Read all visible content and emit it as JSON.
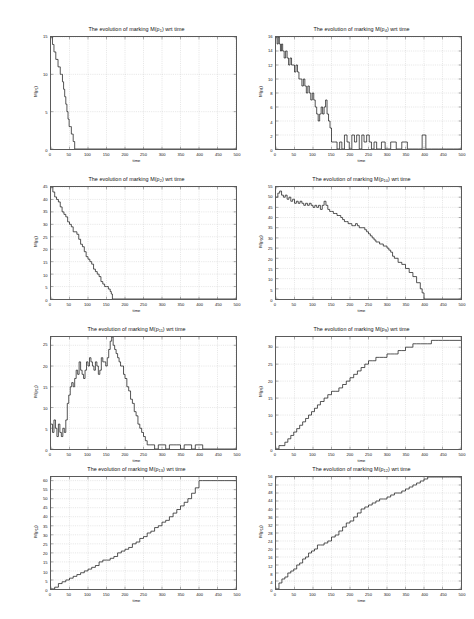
{
  "figure": {
    "background": "#ffffff",
    "line_color": "#1a1a1a",
    "grid_color": "#b9b9b9",
    "axis_color": "#5a5a5a",
    "xlabel": "time",
    "title_prefix": "The evolution of marking M(p",
    "title_suffix": ") wrt time"
  },
  "chart_data": [
    {
      "type": "line",
      "id": "p1",
      "title": "The evolution of marking M(p1) wrt time",
      "place_index": "1",
      "xlabel": "time",
      "ylabel": "M(p1)",
      "xlim": [
        0,
        500
      ],
      "ylim": [
        0,
        15
      ],
      "xticks": [
        0,
        50,
        100,
        150,
        200,
        250,
        300,
        350,
        400,
        450,
        500
      ],
      "yticks": [
        0,
        5,
        10,
        15
      ],
      "grid": true,
      "legend": "none",
      "x": [
        0,
        2,
        4,
        6,
        8,
        10,
        13,
        16,
        19,
        22,
        25,
        28,
        31,
        34,
        37,
        40,
        43,
        46,
        49,
        52,
        55,
        58,
        60,
        62,
        64,
        500
      ],
      "y": [
        15,
        15,
        14,
        14,
        13,
        13,
        12,
        12,
        11,
        11,
        10,
        10,
        9,
        8,
        7,
        6,
        5,
        4,
        3,
        3,
        2,
        2,
        1,
        1,
        0,
        0
      ]
    },
    {
      "type": "line",
      "id": "p4",
      "title": "The evolution of marking M(p4) wrt time",
      "place_index": "4",
      "xlabel": "time",
      "ylabel": "M(p4)",
      "xlim": [
        0,
        500
      ],
      "ylim": [
        0,
        16
      ],
      "xticks": [
        0,
        50,
        100,
        150,
        200,
        250,
        300,
        350,
        400,
        450,
        500
      ],
      "yticks": [
        0,
        2,
        4,
        6,
        8,
        10,
        12,
        14,
        16
      ],
      "grid": true,
      "legend": "none",
      "x": [
        0,
        3,
        6,
        9,
        12,
        15,
        18,
        22,
        26,
        30,
        34,
        38,
        42,
        46,
        50,
        54,
        58,
        62,
        66,
        70,
        74,
        78,
        82,
        86,
        90,
        94,
        98,
        102,
        106,
        110,
        114,
        118,
        122,
        126,
        130,
        134,
        138,
        142,
        146,
        150,
        158,
        165,
        172,
        178,
        185,
        192,
        198,
        205,
        212,
        218,
        225,
        232,
        238,
        245,
        252,
        258,
        265,
        272,
        285,
        295,
        310,
        325,
        340,
        355,
        370,
        385,
        395,
        400,
        405,
        410,
        420,
        440,
        460,
        480,
        500
      ],
      "y": [
        16,
        15,
        16,
        15,
        14,
        15,
        14,
        13,
        14,
        13,
        12,
        13,
        12,
        12,
        11,
        12,
        11,
        10,
        10,
        9,
        10,
        9,
        8,
        9,
        8,
        7,
        8,
        7,
        6,
        5,
        4,
        5,
        6,
        5,
        6,
        7,
        5,
        4,
        3,
        1,
        1,
        0,
        1,
        0,
        2,
        1,
        0,
        2,
        1,
        2,
        0,
        2,
        1,
        2,
        1,
        0,
        1,
        0,
        1,
        0,
        1,
        0,
        1,
        0,
        0,
        0,
        2,
        2,
        0,
        0,
        0,
        0,
        0,
        0,
        0
      ]
    },
    {
      "type": "line",
      "id": "p2",
      "title": "The evolution of marking M(p2) wrt time",
      "place_index": "2",
      "xlabel": "time",
      "ylabel": "M(p2)",
      "xlim": [
        0,
        500
      ],
      "ylim": [
        0,
        45
      ],
      "xticks": [
        0,
        50,
        100,
        150,
        200,
        250,
        300,
        350,
        400,
        450,
        500
      ],
      "yticks": [
        0,
        5,
        10,
        15,
        20,
        25,
        30,
        35,
        40,
        45
      ],
      "grid": true,
      "legend": "none",
      "x": [
        0,
        5,
        10,
        15,
        20,
        25,
        30,
        35,
        40,
        45,
        50,
        55,
        60,
        65,
        70,
        75,
        80,
        85,
        90,
        95,
        100,
        105,
        110,
        115,
        120,
        125,
        130,
        135,
        140,
        145,
        150,
        155,
        160,
        163,
        166,
        500
      ],
      "y": [
        45,
        43,
        41,
        40,
        39,
        37,
        35,
        34,
        33,
        31,
        30,
        29,
        27,
        27,
        26,
        24,
        22,
        21,
        19,
        17,
        16,
        15,
        14,
        12,
        11,
        10,
        9,
        7,
        6,
        5,
        5,
        4,
        3,
        2,
        0,
        0
      ]
    },
    {
      "type": "line",
      "id": "p10",
      "title": "The evolution of marking M(p10) wrt time",
      "place_index": "10",
      "xlabel": "time",
      "ylabel": "M(p10)",
      "xlim": [
        0,
        500
      ],
      "ylim": [
        0,
        55
      ],
      "xticks": [
        0,
        50,
        100,
        150,
        200,
        250,
        300,
        350,
        400,
        450,
        500
      ],
      "yticks": [
        0,
        5,
        10,
        15,
        20,
        25,
        30,
        35,
        40,
        45,
        50,
        55
      ],
      "grid": true,
      "legend": "none",
      "x": [
        0,
        5,
        10,
        15,
        20,
        25,
        30,
        35,
        40,
        45,
        50,
        55,
        60,
        65,
        70,
        75,
        80,
        85,
        90,
        95,
        100,
        105,
        110,
        115,
        120,
        125,
        130,
        135,
        140,
        145,
        150,
        155,
        160,
        165,
        170,
        175,
        180,
        185,
        190,
        195,
        200,
        205,
        210,
        215,
        220,
        225,
        230,
        235,
        240,
        245,
        250,
        255,
        260,
        265,
        270,
        280,
        290,
        300,
        305,
        310,
        315,
        320,
        330,
        340,
        350,
        360,
        370,
        380,
        390,
        395,
        400,
        500
      ],
      "y": [
        50,
        52,
        53,
        51,
        50,
        51,
        49,
        50,
        48,
        49,
        47,
        48,
        47,
        48,
        47,
        46,
        47,
        46,
        47,
        46,
        45,
        46,
        45,
        46,
        44,
        46,
        48,
        46,
        44,
        43,
        43,
        42,
        42,
        41,
        41,
        40,
        39,
        38,
        38,
        37,
        37,
        36,
        36,
        37,
        36,
        35,
        35,
        35,
        34,
        33,
        32,
        31,
        30,
        29,
        28,
        27,
        26,
        25,
        24,
        23,
        21,
        20,
        18,
        17,
        15,
        13,
        11,
        8,
        5,
        3,
        0,
        0
      ]
    },
    {
      "type": "line",
      "id": "p11",
      "title": "The evolution of marking M(p11) wrt time",
      "place_index": "11",
      "xlabel": "time",
      "ylabel": "M(p11)",
      "xlim": [
        0,
        500
      ],
      "ylim": [
        0,
        27
      ],
      "xticks": [
        0,
        50,
        100,
        150,
        200,
        250,
        300,
        350,
        400,
        450,
        500
      ],
      "yticks": [
        0,
        5,
        10,
        15,
        20,
        25
      ],
      "grid": true,
      "legend": "none",
      "x": [
        0,
        4,
        8,
        12,
        16,
        20,
        24,
        28,
        32,
        36,
        40,
        44,
        48,
        52,
        56,
        60,
        64,
        68,
        72,
        76,
        80,
        84,
        88,
        92,
        96,
        100,
        104,
        108,
        112,
        116,
        120,
        124,
        128,
        132,
        136,
        140,
        144,
        148,
        152,
        156,
        160,
        164,
        168,
        172,
        176,
        180,
        184,
        188,
        192,
        196,
        200,
        205,
        210,
        215,
        220,
        225,
        230,
        235,
        240,
        245,
        250,
        255,
        260,
        270,
        280,
        290,
        300,
        310,
        320,
        330,
        340,
        350,
        360,
        370,
        380,
        390,
        400,
        410,
        430,
        450,
        470,
        500
      ],
      "y": [
        6,
        4,
        7,
        5,
        3,
        6,
        4,
        3,
        5,
        4,
        7,
        11,
        13,
        15,
        16,
        15,
        17,
        19,
        18,
        21,
        19,
        18,
        17,
        19,
        21,
        20,
        22,
        21,
        20,
        19,
        21,
        20,
        18,
        19,
        22,
        21,
        21,
        20,
        22,
        24,
        26,
        27,
        25,
        24,
        23,
        22,
        21,
        20,
        20,
        18,
        17,
        15,
        14,
        12,
        11,
        9,
        8,
        6,
        5,
        4,
        3,
        2,
        1,
        1,
        0,
        1,
        1,
        0,
        1,
        1,
        1,
        0,
        1,
        1,
        0,
        1,
        1,
        0,
        0,
        0,
        0,
        0
      ]
    },
    {
      "type": "line",
      "id": "p9",
      "title": "The evolution of marking M(p9) wrt time",
      "place_index": "9",
      "xlabel": "time",
      "ylabel": "M(p9)",
      "xlim": [
        0,
        500
      ],
      "ylim": [
        0,
        33
      ],
      "xticks": [
        0,
        50,
        100,
        150,
        200,
        250,
        300,
        350,
        400,
        450,
        500
      ],
      "yticks": [
        0,
        5,
        10,
        15,
        20,
        25,
        30
      ],
      "grid": true,
      "legend": "none",
      "x": [
        0,
        8,
        16,
        24,
        32,
        40,
        48,
        56,
        64,
        72,
        80,
        88,
        96,
        104,
        112,
        120,
        130,
        140,
        150,
        160,
        170,
        180,
        190,
        200,
        210,
        220,
        230,
        240,
        250,
        260,
        270,
        280,
        290,
        300,
        310,
        320,
        330,
        340,
        350,
        360,
        370,
        380,
        390,
        400,
        410,
        420,
        430,
        440,
        450,
        470,
        500
      ],
      "y": [
        0,
        1,
        1,
        2,
        3,
        4,
        5,
        6,
        7,
        8,
        9,
        10,
        11,
        12,
        13,
        14,
        15,
        16,
        17,
        17,
        18,
        19,
        20,
        21,
        22,
        23,
        24,
        25,
        26,
        26,
        27,
        27,
        27,
        28,
        28,
        28,
        29,
        29,
        30,
        30,
        31,
        31,
        31,
        31,
        31,
        32,
        32,
        32,
        32,
        32,
        32
      ]
    },
    {
      "type": "line",
      "id": "p13",
      "title": "The evolution of marking M(p13) wrt time",
      "place_index": "13",
      "xlabel": "time",
      "ylabel": "M(p13)",
      "xlim": [
        0,
        500
      ],
      "ylim": [
        0,
        62
      ],
      "xticks": [
        0,
        50,
        100,
        150,
        200,
        250,
        300,
        350,
        400,
        450,
        500
      ],
      "yticks": [
        0,
        5,
        10,
        15,
        20,
        25,
        30,
        35,
        40,
        45,
        50,
        55,
        60
      ],
      "grid": true,
      "legend": "none",
      "x": [
        0,
        10,
        20,
        30,
        40,
        50,
        60,
        70,
        80,
        90,
        100,
        110,
        120,
        130,
        140,
        150,
        160,
        170,
        180,
        190,
        200,
        210,
        220,
        230,
        240,
        250,
        260,
        270,
        280,
        290,
        300,
        310,
        320,
        330,
        340,
        350,
        360,
        370,
        380,
        390,
        400,
        410,
        430,
        450,
        470,
        500
      ],
      "y": [
        0,
        1,
        3,
        4,
        5,
        6,
        7,
        8,
        9,
        10,
        11,
        12,
        13,
        15,
        16,
        16,
        17,
        18,
        20,
        21,
        22,
        23,
        25,
        26,
        28,
        29,
        31,
        32,
        34,
        35,
        37,
        38,
        40,
        42,
        44,
        46,
        48,
        50,
        53,
        56,
        60,
        60,
        60,
        60,
        60,
        60
      ]
    },
    {
      "type": "line",
      "id": "p12",
      "title": "The evolution of marking M(p12) wrt time",
      "place_index": "12",
      "xlabel": "time",
      "ylabel": "M(p12)",
      "xlim": [
        0,
        500
      ],
      "ylim": [
        0,
        56
      ],
      "xticks": [
        0,
        50,
        100,
        150,
        200,
        250,
        300,
        350,
        400,
        450,
        500
      ],
      "yticks": [
        0,
        4,
        8,
        12,
        16,
        20,
        24,
        28,
        32,
        36,
        40,
        44,
        48,
        52,
        56
      ],
      "grid": true,
      "legend": "none",
      "x": [
        0,
        8,
        16,
        24,
        32,
        40,
        48,
        56,
        64,
        72,
        80,
        88,
        96,
        104,
        112,
        120,
        130,
        140,
        150,
        160,
        170,
        180,
        190,
        200,
        210,
        220,
        230,
        240,
        250,
        260,
        270,
        280,
        290,
        300,
        310,
        320,
        330,
        340,
        350,
        360,
        370,
        380,
        390,
        400,
        410,
        430,
        450,
        470,
        500
      ],
      "y": [
        0,
        3,
        5,
        6,
        8,
        9,
        10,
        12,
        13,
        15,
        16,
        18,
        19,
        20,
        22,
        22,
        23,
        24,
        26,
        27,
        29,
        31,
        33,
        34,
        36,
        38,
        40,
        41,
        42,
        43,
        44,
        45,
        45,
        46,
        47,
        48,
        48,
        49,
        50,
        51,
        52,
        53,
        54,
        55,
        56,
        56,
        56,
        56,
        56
      ]
    }
  ]
}
